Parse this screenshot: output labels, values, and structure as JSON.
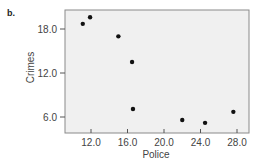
{
  "panel_label": "b.",
  "chart_data": {
    "type": "scatter",
    "title": "",
    "xlabel": "Police",
    "ylabel": "Crimes",
    "xlim": [
      8.0,
      29.5
    ],
    "ylim": [
      4.3,
      21.5
    ],
    "xticks": [
      12.0,
      16.0,
      20.0,
      24.0,
      28.0
    ],
    "xtick_labels": [
      "12.0",
      "16.0",
      "20.0",
      "24.0",
      "28.0"
    ],
    "yticks": [
      6.0,
      12.0,
      18.0
    ],
    "ytick_labels": [
      "6.0",
      "12.0",
      "18.0"
    ],
    "grid": false,
    "legend": null,
    "plot_background": "#f0f0f0",
    "marker_color": "#111111",
    "points": [
      {
        "x": 11.1,
        "y": 18.7
      },
      {
        "x": 11.9,
        "y": 19.6
      },
      {
        "x": 15.0,
        "y": 17.0
      },
      {
        "x": 16.5,
        "y": 13.5
      },
      {
        "x": 16.6,
        "y": 7.1
      },
      {
        "x": 22.0,
        "y": 5.6
      },
      {
        "x": 24.5,
        "y": 5.2
      },
      {
        "x": 27.6,
        "y": 6.7
      }
    ]
  }
}
